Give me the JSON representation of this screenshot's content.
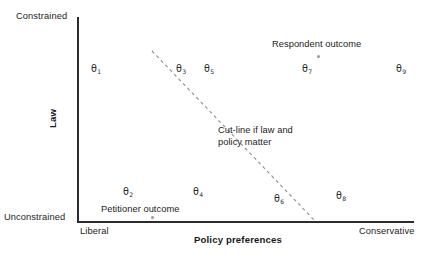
{
  "chart_data": {
    "type": "scatter",
    "title": "",
    "xlabel": "Policy preferences",
    "ylabel": "Law",
    "xlim": [
      "Liberal",
      "Conservative"
    ],
    "ylim": [
      "Unconstrained",
      "Constrained"
    ],
    "grid": false,
    "legend": "none",
    "x_tick_labels": [
      "Liberal",
      "Conservative"
    ],
    "y_tick_labels": [
      "Unconstrained",
      "Constrained"
    ],
    "points": [
      {
        "label": "θ1",
        "sub": "1",
        "x": 0.09,
        "y": 0.78
      },
      {
        "label": "θ3",
        "sub": "3",
        "x": 0.32,
        "y": 0.78
      },
      {
        "label": "θ5",
        "sub": "5",
        "x": 0.4,
        "y": 0.78
      },
      {
        "label": "θ7",
        "sub": "7",
        "x": 0.68,
        "y": 0.78
      },
      {
        "label": "θ9",
        "sub": "9",
        "x": 0.96,
        "y": 0.78
      },
      {
        "label": "θ2",
        "sub": "2",
        "x": 0.15,
        "y": 0.16
      },
      {
        "label": "θ4",
        "sub": "4",
        "x": 0.36,
        "y": 0.16
      },
      {
        "label": "θ6",
        "sub": "6",
        "x": 0.6,
        "y": 0.16
      },
      {
        "label": "θ8",
        "sub": "8",
        "x": 0.78,
        "y": 0.16
      }
    ],
    "outcomes": [
      {
        "name": "Respondent outcome",
        "x": 0.71,
        "y": 0.81
      },
      {
        "name": "Petitioner outcome",
        "x": 0.22,
        "y": 0.03
      }
    ],
    "cutline": {
      "label": "Cut-line if law and policy matter",
      "style": "dashed",
      "x1": 152,
      "y1": 51,
      "x2": 316,
      "y2": 222
    }
  },
  "axes": {
    "y_title": "Law",
    "x_title": "Policy preferences",
    "y_top_label": "Constrained",
    "y_bottom_label": "Unconstrained",
    "x_left_label": "Liberal",
    "x_right_label": "Conservative"
  },
  "thetas": {
    "t1": {
      "glyph": "θ",
      "sub": "1"
    },
    "t2": {
      "glyph": "θ",
      "sub": "2"
    },
    "t3": {
      "glyph": "θ",
      "sub": "3"
    },
    "t4": {
      "glyph": "θ",
      "sub": "4"
    },
    "t5": {
      "glyph": "θ",
      "sub": "5"
    },
    "t6": {
      "glyph": "θ",
      "sub": "6"
    },
    "t7": {
      "glyph": "θ",
      "sub": "7"
    },
    "t8": {
      "glyph": "θ",
      "sub": "8"
    },
    "t9": {
      "glyph": "θ",
      "sub": "9"
    }
  },
  "annotations": {
    "respondent": "Respondent outcome",
    "petitioner": "Petitioner outcome",
    "cutline_line1": "Cut-line if law and",
    "cutline_line2": "policy matter"
  },
  "colors": {
    "axis": "#2b2b2b",
    "text": "#1c1c1c",
    "cutline": "#8d8d8d",
    "dot": "#9a9a9a",
    "background": "#ffffff"
  }
}
